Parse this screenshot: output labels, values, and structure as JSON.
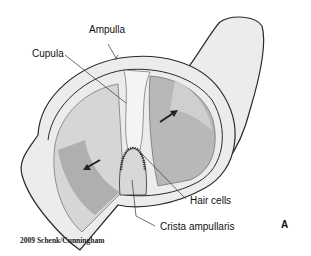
{
  "figure": {
    "panel_letter": "A",
    "credit": "2009 Schenk/Cunningham",
    "labels": {
      "ampulla": "Ampulla",
      "cupula": "Cupula",
      "hair_cells": "Hair cells",
      "crista_ampullaris": "Crista ampullaris"
    },
    "colors": {
      "outline": "#2a2a2a",
      "wall_fill": "#ececec",
      "endolymph_light": "#d6d6d6",
      "endolymph_dark": "#a8a8a8",
      "cupula_fill": "#f4f4f4"
    }
  }
}
